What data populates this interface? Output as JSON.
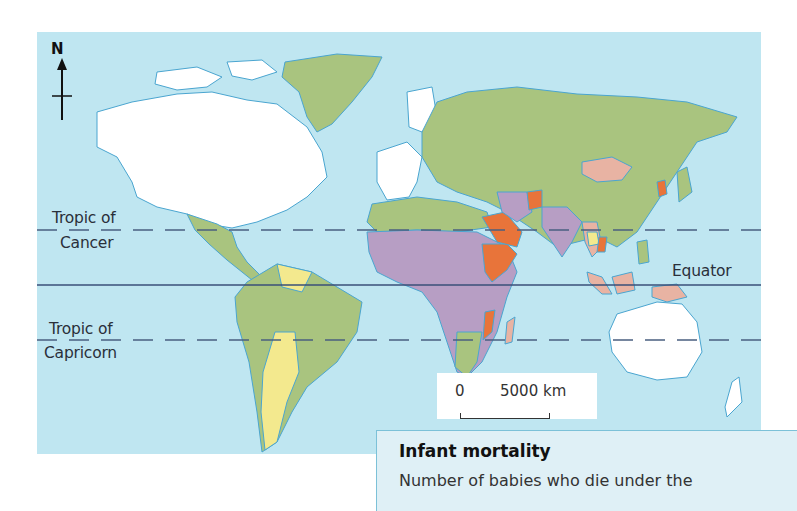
{
  "map": {
    "compass_label": "N",
    "lines": {
      "tropic_cancer_line1": "Tropic of",
      "tropic_cancer_line2": "Cancer",
      "equator": "Equator",
      "tropic_capricorn_line1": "Tropic of",
      "tropic_capricorn_line2": "Capricorn"
    },
    "scale": {
      "start": "0",
      "end": "5000 km"
    },
    "colors": {
      "ocean": "#bfe6f1",
      "green": "#a9c47f",
      "white": "#ffffff",
      "purple": "#b79ec4",
      "orange": "#e8743a",
      "pink": "#e8b3a3",
      "yellow": "#f3e98e",
      "coast": "#4aa5d0"
    }
  },
  "legend": {
    "title": "Infant mortality",
    "description": "Number of babies who die under the"
  }
}
